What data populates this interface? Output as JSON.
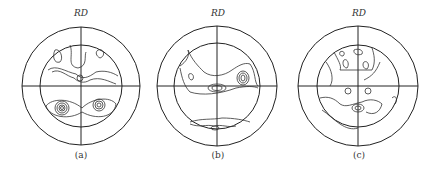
{
  "figure": {
    "panels": [
      {
        "id": "a",
        "axis_label": "RD",
        "caption": "(a)"
      },
      {
        "id": "b",
        "axis_label": "RD",
        "caption": "(b)"
      },
      {
        "id": "c",
        "axis_label": "RD",
        "caption": "(c)"
      }
    ]
  }
}
